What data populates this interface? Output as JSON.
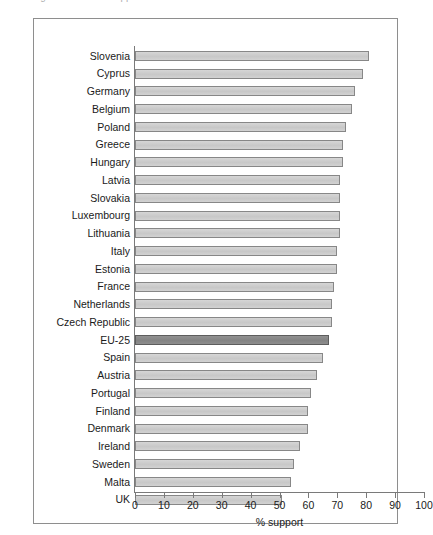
{
  "caption": {
    "text": "Figure 1.1  Public support for ... across the EU"
  },
  "chart_data": {
    "type": "bar",
    "orientation": "horizontal",
    "title": "",
    "xlabel": "% support",
    "ylabel": "",
    "xlim": [
      0,
      100
    ],
    "xticks": [
      0,
      10,
      20,
      30,
      40,
      50,
      60,
      70,
      80,
      90,
      100
    ],
    "grid": false,
    "legend": false,
    "highlight_category": "EU-25",
    "colors": {
      "bar_fill": "#cbcbcb",
      "bar_border": "#878787",
      "highlight_fill": "#8a8a8a",
      "highlight_border": "#5d5d5d",
      "axis": "#7a7a7a",
      "frame": "#8e8e8e",
      "text": "#1a1a1a"
    },
    "categories": [
      "Slovenia",
      "Cyprus",
      "Germany",
      "Belgium",
      "Poland",
      "Greece",
      "Hungary",
      "Latvia",
      "Slovakia",
      "Luxembourg",
      "Lithuania",
      "Italy",
      "Estonia",
      "France",
      "Netherlands",
      "Czech Republic",
      "EU-25",
      "Spain",
      "Austria",
      "Portugal",
      "Finland",
      "Denmark",
      "Ireland",
      "Sweden",
      "Malta",
      "UK"
    ],
    "values": [
      81,
      79,
      76,
      75,
      73,
      72,
      72,
      71,
      71,
      71,
      71,
      70,
      70,
      69,
      68,
      68,
      67,
      65,
      63,
      61,
      60,
      60,
      57,
      55,
      54,
      51
    ]
  }
}
